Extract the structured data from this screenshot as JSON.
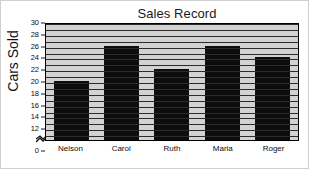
{
  "chart_data": {
    "type": "bar",
    "title": "Sales Record",
    "xlabel": "",
    "ylabel": "Cars Sold",
    "categories": [
      "Nelson",
      "Carol",
      "Ruth",
      "Maria",
      "Roger"
    ],
    "values": [
      20,
      26,
      22,
      26,
      24
    ],
    "ylim": [
      10,
      30
    ],
    "yticks": [
      30,
      28,
      26,
      24,
      22,
      20,
      18,
      16,
      14,
      12,
      0
    ],
    "axis_break": true,
    "axis_break_between": [
      12,
      0
    ],
    "grid": true,
    "legend": null,
    "series": [
      {
        "name": "Cars Sold",
        "values": [
          20,
          26,
          22,
          26,
          24
        ]
      }
    ],
    "colors": {
      "bar": "#0d0d0d",
      "plot_background": "#d2d2d2",
      "gridline": "#2b2b2b",
      "axis": "#000000",
      "text": "#0d0d0d",
      "figure_background": "#ffffff"
    }
  }
}
